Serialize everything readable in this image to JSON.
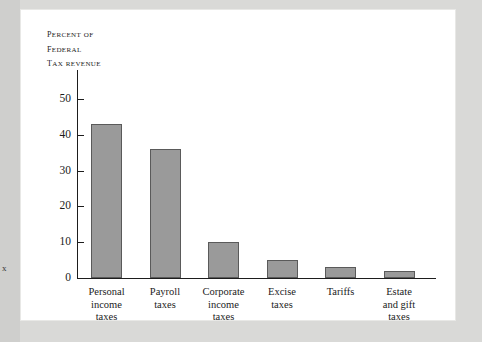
{
  "figure": {
    "axis_title_lines": [
      "Percent of",
      "Federal",
      "Tax Revenue"
    ],
    "edge_artifact": "x"
  },
  "chart_data": {
    "type": "bar",
    "title": "",
    "subtitle": "",
    "xlabel": "",
    "ylabel": "Percent of Federal Tax Revenue",
    "ylim": [
      0,
      50
    ],
    "yticks": [
      0,
      10,
      20,
      30,
      40,
      50
    ],
    "ytick_labels": [
      "0",
      "10",
      "20",
      "30",
      "40",
      "50"
    ],
    "grid": false,
    "legend": false,
    "categories": [
      "Personal income taxes",
      "Payroll taxes",
      "Corporate income taxes",
      "Excise taxes",
      "Tariffs",
      "Estate and gift taxes"
    ],
    "category_label_lines": [
      [
        "Personal",
        "income",
        "taxes"
      ],
      [
        "Payroll",
        "taxes"
      ],
      [
        "Corporate",
        "income",
        "taxes"
      ],
      [
        "Excise",
        "taxes"
      ],
      [
        "Tariffs"
      ],
      [
        "Estate",
        "and gift",
        "taxes"
      ]
    ],
    "values": [
      43,
      36,
      10,
      5,
      3,
      2
    ],
    "bar_color": "#9a9a9a",
    "bar_edge_color": "#5a5a5a",
    "axis_color": "#1d1d1d",
    "background": "#ffffff"
  }
}
